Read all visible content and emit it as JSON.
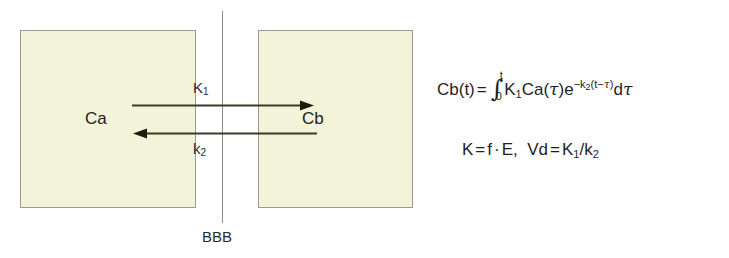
{
  "figure": {
    "type": "two-compartment-bbb-kinetic-model",
    "background_color": "#ffffff",
    "compartment_fill_color": "#f2f3d9",
    "compartment_border_color": "#9a9a90",
    "line_color": "#3a3a2a",
    "text_color": "#2b2b2b"
  },
  "compartments": {
    "left": {
      "label": "Ca"
    },
    "right": {
      "label": "Cb"
    }
  },
  "membrane": {
    "label": "BBB"
  },
  "rate_constants": {
    "influx": {
      "symbol": "K",
      "subscript": "1",
      "display": "K1"
    },
    "efflux": {
      "symbol": "k",
      "subscript": "2",
      "display": "k2"
    }
  },
  "arrows": {
    "influx_direction": "left-to-right",
    "efflux_direction": "right-to-left"
  },
  "equations": {
    "convolution": {
      "lhs": "Cb",
      "lhs_arg": "(t)",
      "equals": "=",
      "integral_lower": "0",
      "integral_upper": "t",
      "integrand_k": "K",
      "integrand_k_sub": "1",
      "integrand_ca": "Ca",
      "integrand_ca_arg_open": "(",
      "integrand_tau": "τ",
      "integrand_ca_arg_close": ")",
      "exp_base": "e",
      "exp_sup_prefix": "−k",
      "exp_sup_sub": "2",
      "exp_sup_open": "(t−",
      "exp_sup_tau": "τ",
      "exp_sup_close": ")",
      "differential": "d",
      "differential_tau": "τ",
      "plain_text": "Cb(t) = ∫₀ᵗ K₁Ca(τ)e⁻ᵏ²⁽ᵗ⁻τ⁾ dτ"
    },
    "relations": {
      "k_symbol": "K",
      "k_equals": "=",
      "k_f": "f",
      "k_dot": "·",
      "k_e": "E",
      "comma": ",",
      "vd_symbol": "Vd",
      "vd_equals": "=",
      "vd_num": "K",
      "vd_num_sub": "1",
      "vd_slash": "/",
      "vd_den": "k",
      "vd_den_sub": "2",
      "plain_text": "K = f · E,  Vd = K₁/k₂"
    }
  }
}
